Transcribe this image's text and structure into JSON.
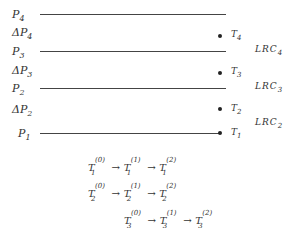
{
  "levels": [
    {
      "label": "P",
      "sub": "4",
      "y": 14
    },
    {
      "label": "P",
      "sub": "3",
      "y": 51
    },
    {
      "label": "P",
      "sub": "2",
      "y": 88
    },
    {
      "label": "P",
      "sub": "1",
      "y": 133
    }
  ],
  "deltas": [
    {
      "label": "ΔP",
      "sub": "4",
      "y": 31
    },
    {
      "label": "ΔP",
      "sub": "3",
      "y": 70
    },
    {
      "label": "ΔP",
      "sub": "2",
      "y": 108
    }
  ],
  "points": [
    {
      "label": "T",
      "sub": "4",
      "y": 35
    },
    {
      "label": "T",
      "sub": "3",
      "y": 72
    },
    {
      "label": "T",
      "sub": "2",
      "y": 108
    },
    {
      "label": "T",
      "sub": "1",
      "y": 132
    }
  ],
  "lrc": [
    {
      "label": "LRC",
      "sub": "4",
      "y": 47
    },
    {
      "label": "LRC",
      "sub": "3",
      "y": 86
    },
    {
      "label": "LRC",
      "sub": "2",
      "y": 121
    }
  ],
  "sequences": [
    {
      "var": "T",
      "index": "1",
      "steps": [
        "(0)",
        "(1)",
        "(2)"
      ]
    },
    {
      "var": "T",
      "index": "2",
      "steps": [
        "(0)",
        "(1)",
        "(2)"
      ]
    },
    {
      "var": "T",
      "index": "3",
      "steps": [
        "(0)",
        "(1)",
        "(2)"
      ]
    }
  ],
  "arrow": "→"
}
